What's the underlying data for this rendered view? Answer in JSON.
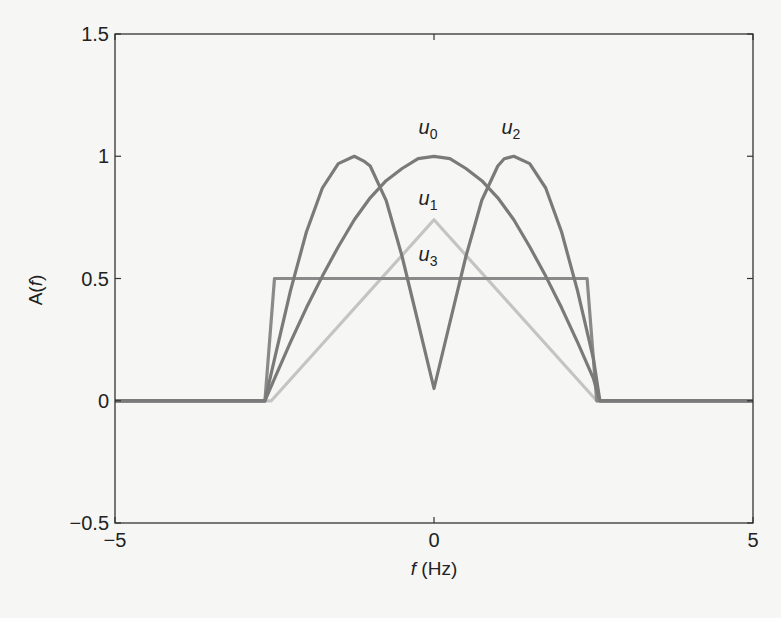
{
  "chart_data": {
    "type": "line",
    "title": "",
    "xlabel": "f (Hz)",
    "xlabel_italic_part": "f",
    "xlabel_rest": " (Hz)",
    "ylabel": "A(f)",
    "xlim": [
      -5,
      5
    ],
    "ylim": [
      -0.5,
      1.5
    ],
    "xticks": [
      -5,
      0,
      5
    ],
    "xtick_labels": [
      "−5",
      "0",
      "5"
    ],
    "yticks": [
      -0.5,
      0,
      0.5,
      1,
      1.5
    ],
    "ytick_labels": [
      "−0.5",
      "0",
      "0.5",
      "1",
      "1.5"
    ],
    "grid": false,
    "legend": "inline labels near curve peaks",
    "series": [
      {
        "name": "u0",
        "label_base": "u",
        "label_sub": "0",
        "color": "#7a7a7a",
        "label_at": [
          0,
          1.09
        ],
        "x": [
          -5,
          -2.65,
          -2.5,
          -2.25,
          -2,
          -1.75,
          -1.5,
          -1.25,
          -1,
          -0.75,
          -0.5,
          -0.25,
          0,
          0.25,
          0.5,
          0.75,
          1,
          1.25,
          1.5,
          1.75,
          2,
          2.25,
          2.5,
          2.6,
          5
        ],
        "y": [
          0,
          0,
          0.09,
          0.24,
          0.38,
          0.51,
          0.63,
          0.74,
          0.83,
          0.9,
          0.95,
          0.99,
          1.0,
          0.99,
          0.95,
          0.9,
          0.83,
          0.74,
          0.63,
          0.51,
          0.38,
          0.24,
          0.09,
          0,
          0
        ]
      },
      {
        "name": "u1",
        "label_base": "u",
        "label_sub": "1",
        "color": "#c4c4c4",
        "label_at": [
          0,
          0.8
        ],
        "x": [
          -5,
          -2.55,
          0,
          2.55,
          5
        ],
        "y": [
          0,
          0,
          0.74,
          0,
          0
        ]
      },
      {
        "name": "u2",
        "label_base": "u",
        "label_sub": "2",
        "color": "#7a7a7a",
        "label_at": [
          1.3,
          1.09
        ],
        "x": [
          -5,
          -2.65,
          -2.5,
          -2.25,
          -2,
          -1.75,
          -1.5,
          -1.25,
          -1.1,
          -1,
          -0.75,
          -0.5,
          -0.25,
          0,
          0.25,
          0.5,
          0.75,
          1,
          1.1,
          1.25,
          1.5,
          1.75,
          2,
          2.25,
          2.5,
          2.6,
          5
        ],
        "y": [
          0,
          0,
          0.17,
          0.45,
          0.69,
          0.87,
          0.97,
          1.0,
          0.98,
          0.96,
          0.82,
          0.59,
          0.32,
          0.05,
          0.32,
          0.59,
          0.82,
          0.96,
          0.99,
          1.0,
          0.97,
          0.87,
          0.69,
          0.45,
          0.17,
          0,
          0
        ]
      },
      {
        "name": "u3",
        "label_base": "u",
        "label_sub": "3",
        "color": "#8a8a8a",
        "label_at": [
          0,
          0.57
        ],
        "x": [
          -5,
          -2.65,
          -2.5,
          2.4,
          2.55,
          5
        ],
        "y": [
          0,
          0,
          0.5,
          0.5,
          0,
          0
        ]
      }
    ]
  }
}
